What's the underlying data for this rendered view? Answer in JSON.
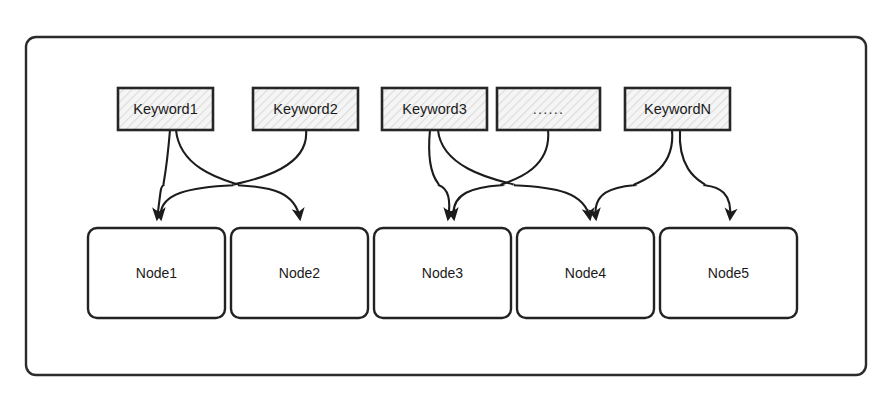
{
  "diagram": {
    "frame": {
      "name": "outer-frame",
      "x": 26,
      "y": 37,
      "width": 840,
      "height": 338,
      "corner_radius": 10,
      "fill": "#ffffff",
      "stroke": "#2b2b2b"
    },
    "style": {
      "keyword_fill": "#f4f4f4",
      "keyword_hatch": "#dcdcdc",
      "keyword_stroke": "#262626",
      "node_fill": "#ffffff",
      "node_stroke": "#222222",
      "edge_stroke": "#1c1c1c",
      "text_color": "#1a1a1a",
      "background": "#ffffff"
    },
    "keywords": [
      {
        "id": "kw1",
        "label": "Keyword1",
        "x": 118,
        "y": 88,
        "width": 95,
        "height": 42,
        "hatched": true
      },
      {
        "id": "kw2",
        "label": "Keyword2",
        "x": 253,
        "y": 88,
        "width": 105,
        "height": 42,
        "hatched": true
      },
      {
        "id": "kw3",
        "label": "Keyword3",
        "x": 382,
        "y": 88,
        "width": 105,
        "height": 42,
        "hatched": true
      },
      {
        "id": "kwdots",
        "label": "......",
        "x": 497,
        "y": 88,
        "width": 103,
        "height": 42,
        "hatched": true
      },
      {
        "id": "kwn",
        "label": "KeywordN",
        "x": 625,
        "y": 88,
        "width": 105,
        "height": 42,
        "hatched": true
      }
    ],
    "nodes": [
      {
        "id": "n1",
        "label": "Node1",
        "x": 88,
        "y": 228,
        "width": 137,
        "height": 90,
        "corner_radius": 9
      },
      {
        "id": "n2",
        "label": "Node2",
        "x": 231,
        "y": 228,
        "width": 137,
        "height": 90,
        "corner_radius": 9
      },
      {
        "id": "n3",
        "label": "Node3",
        "x": 374,
        "y": 228,
        "width": 137,
        "height": 90,
        "corner_radius": 9
      },
      {
        "id": "n4",
        "label": "Node4",
        "x": 517,
        "y": 228,
        "width": 137,
        "height": 90,
        "corner_radius": 9
      },
      {
        "id": "n5",
        "label": "Node5",
        "x": 660,
        "y": 228,
        "width": 137,
        "height": 90,
        "corner_radius": 9
      }
    ],
    "edges": [
      {
        "id": "e1",
        "from": "kw1",
        "to": "n1",
        "from_x": 170,
        "to_x": 157,
        "bow": -26
      },
      {
        "id": "e2",
        "from": "kw1",
        "to": "n2",
        "from_x": 176,
        "to_x": 300,
        "bow": 30
      },
      {
        "id": "e3",
        "from": "kw2",
        "to": "n1",
        "from_x": 306,
        "to_x": 161,
        "bow": 30
      },
      {
        "id": "e4",
        "from": "kw3",
        "to": "n3",
        "from_x": 430,
        "to_x": 448,
        "bow": -30
      },
      {
        "id": "e5",
        "from": "kw3",
        "to": "n4",
        "from_x": 438,
        "to_x": 590,
        "bow": 30
      },
      {
        "id": "e6",
        "from": "kwdots",
        "to": "n3",
        "from_x": 548,
        "to_x": 454,
        "bow": 30
      },
      {
        "id": "e7",
        "from": "kwn",
        "to": "n4",
        "from_x": 672,
        "to_x": 596,
        "bow": 28
      },
      {
        "id": "e8",
        "from": "kwn",
        "to": "n5",
        "from_x": 680,
        "to_x": 730,
        "bow": -18
      }
    ]
  }
}
